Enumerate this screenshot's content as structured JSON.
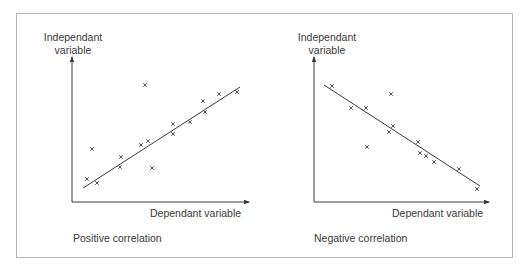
{
  "chart_data": [
    {
      "type": "scatter",
      "title": "Positive correlation",
      "xlabel": "Dependant variable",
      "ylabel": "Independant variable",
      "xlim": [
        0,
        100
      ],
      "ylim": [
        0,
        100
      ],
      "grid": false,
      "legend": null,
      "ticks": "none",
      "points": [
        {
          "x": 8.5,
          "y": 16.0
        },
        {
          "x": 11.4,
          "y": 36.8
        },
        {
          "x": 14.2,
          "y": 13.2
        },
        {
          "x": 27.3,
          "y": 24.3
        },
        {
          "x": 27.8,
          "y": 31.3
        },
        {
          "x": 39.2,
          "y": 39.6
        },
        {
          "x": 41.5,
          "y": 81.3
        },
        {
          "x": 43.2,
          "y": 42.4
        },
        {
          "x": 45.5,
          "y": 23.6
        },
        {
          "x": 57.4,
          "y": 54.2
        },
        {
          "x": 57.4,
          "y": 47.2
        },
        {
          "x": 67.0,
          "y": 55.6
        },
        {
          "x": 74.4,
          "y": 70.1
        },
        {
          "x": 75.6,
          "y": 62.5
        },
        {
          "x": 83.5,
          "y": 75.0
        },
        {
          "x": 93.8,
          "y": 76.4
        }
      ],
      "trend_line": {
        "x1": 6.3,
        "y1": 9.7,
        "x2": 95.5,
        "y2": 79.9
      },
      "marker": "x"
    },
    {
      "type": "scatter",
      "title": "Negative correlation",
      "xlabel": "Dependant variable",
      "ylabel": "Independant variable",
      "xlim": [
        0,
        100
      ],
      "ylim": [
        0,
        100
      ],
      "grid": false,
      "legend": null,
      "ticks": "none",
      "points": [
        {
          "x": 10.3,
          "y": 80.6
        },
        {
          "x": 21.3,
          "y": 65.3
        },
        {
          "x": 29.9,
          "y": 65.3
        },
        {
          "x": 30.5,
          "y": 38.2
        },
        {
          "x": 43.1,
          "y": 48.6
        },
        {
          "x": 44.3,
          "y": 75.0
        },
        {
          "x": 45.4,
          "y": 52.8
        },
        {
          "x": 59.8,
          "y": 41.7
        },
        {
          "x": 60.9,
          "y": 34.0
        },
        {
          "x": 64.4,
          "y": 31.9
        },
        {
          "x": 69.0,
          "y": 27.8
        },
        {
          "x": 83.3,
          "y": 22.9
        },
        {
          "x": 93.7,
          "y": 9.0
        }
      ],
      "trend_line": {
        "x1": 5.7,
        "y1": 81.3,
        "x2": 95.4,
        "y2": 11.1
      },
      "marker": "x"
    }
  ],
  "panels": {
    "left": {
      "ylabel_line1": "Independant",
      "ylabel_line2": "variable",
      "xlabel": "Dependant variable",
      "caption": "Positive correlation"
    },
    "right": {
      "ylabel_line1": "Independant",
      "ylabel_line2": "variable",
      "xlabel": "Dependant variable",
      "caption": "Negative correlation"
    }
  },
  "colors": {
    "ink": "#3a3a3a",
    "frame": "#b5b5b5",
    "background": "#ffffff"
  }
}
